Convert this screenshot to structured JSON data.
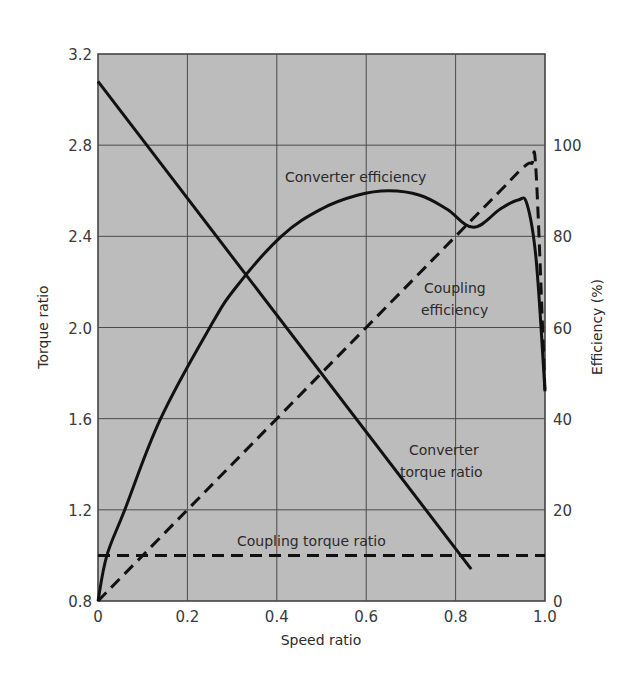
{
  "chart_data": {
    "type": "line",
    "title": "",
    "xlabel": "Speed ratio",
    "ylabel": "Torque ratio",
    "y2label": "Efficiency (%)",
    "xlim": [
      0,
      1.0
    ],
    "ylim": [
      0.8,
      3.2
    ],
    "y2lim": [
      0,
      120
    ],
    "grid": true,
    "background": "#bcbcbc",
    "x_ticks": [
      "0",
      "0.2",
      "0.4",
      "0.6",
      "0.8",
      "1.0"
    ],
    "y_ticks": [
      "0.8",
      "1.2",
      "1.6",
      "2.0",
      "2.4",
      "2.8",
      "3.2"
    ],
    "y2_ticks": [
      "0",
      "20",
      "40",
      "60",
      "80",
      "100"
    ],
    "series": [
      {
        "name": "Converter torque ratio",
        "axis": "left",
        "style": "solid",
        "x": [
          0,
          0.835
        ],
        "y": [
          3.08,
          0.94
        ]
      },
      {
        "name": "Coupling torque ratio",
        "axis": "left",
        "style": "dashed",
        "x": [
          0,
          1.0
        ],
        "y": [
          1.0,
          1.0
        ]
      },
      {
        "name": "Converter efficiency",
        "axis": "right",
        "style": "solid",
        "x": [
          0,
          0.02,
          0.06,
          0.14,
          0.25,
          0.31,
          0.41,
          0.5,
          0.58,
          0.65,
          0.72,
          0.78,
          0.84,
          0.9,
          0.94,
          0.96,
          0.98,
          1.0
        ],
        "y": [
          0,
          10,
          20,
          40,
          60,
          69,
          80,
          86,
          89,
          90,
          89,
          86,
          82,
          86,
          88,
          87,
          75,
          46
        ]
      },
      {
        "name": "Coupling efficiency",
        "axis": "right",
        "style": "dashed",
        "x": [
          0,
          0.2,
          0.4,
          0.6,
          0.8,
          0.9,
          0.95,
          0.97,
          0.98,
          1.0
        ],
        "y": [
          0,
          20,
          40,
          60,
          80,
          90,
          95,
          96,
          94,
          46
        ]
      }
    ],
    "annotations": [
      {
        "text": "Converter efficiency",
        "x": 0.56,
        "y2": 91
      },
      {
        "text": "Coupling efficiency",
        "x": 0.86,
        "y2": 70
      },
      {
        "text": "Converter torque ratio",
        "x": 0.78,
        "y": 1.45
      },
      {
        "text": "Coupling torque ratio",
        "x": 0.45,
        "y": 1.06
      }
    ]
  },
  "labels": {
    "xlabel": "Speed ratio",
    "ylabel": "Torque ratio",
    "y2label": "Efficiency (%)",
    "annot_converter_eff": "Converter efficiency",
    "annot_coupling_eff_1": "Coupling",
    "annot_coupling_eff_2": "efficiency",
    "annot_converter_torque_1": "Converter",
    "annot_converter_torque_2": "torque ratio",
    "annot_coupling_torque": "Coupling torque ratio"
  }
}
